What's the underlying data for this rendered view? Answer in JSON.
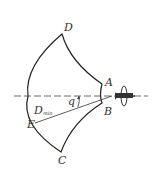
{
  "diagram": {
    "type": "coverage-zone",
    "points": {
      "A": "A",
      "B": "B",
      "C": "C",
      "D": "D",
      "E": "E"
    },
    "labels": {
      "range_label": "D",
      "range_subscript": "min",
      "angle_label": "q"
    },
    "colors": {
      "stroke": "#222222",
      "background": "#ffffff"
    }
  }
}
